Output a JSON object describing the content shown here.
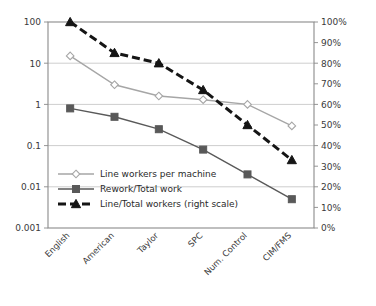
{
  "chart_data": {
    "type": "line",
    "title": "",
    "subtitle": "",
    "xlabel": "",
    "ylabel": "",
    "categories": [
      "English",
      "American",
      "Taylor",
      "SPC",
      "Num. Control",
      "CIM/FMS"
    ],
    "left_axis": {
      "scale": "log",
      "ylim": [
        0.001,
        100
      ],
      "ticks": [
        100,
        10,
        1,
        0.1,
        0.01,
        0.001
      ],
      "tick_labels": [
        "100",
        "10",
        "1",
        "0.1",
        "0.01",
        "0.001"
      ],
      "grid": true
    },
    "right_axis": {
      "scale": "linear",
      "ylim": [
        0,
        100
      ],
      "ticks": [
        100,
        90,
        80,
        70,
        60,
        50,
        40,
        30,
        20,
        10,
        0
      ],
      "tick_labels": [
        "100%",
        "90%",
        "80%",
        "70%",
        "60%",
        "50%",
        "40%",
        "30%",
        "20%",
        "10%",
        "0%"
      ],
      "grid": false
    },
    "legend_position": "inside-lower-left",
    "series": [
      {
        "name": "Line workers per machine",
        "axis": "left",
        "marker": "diamond",
        "color": "#a6a6a6",
        "line_style": "solid",
        "values": [
          15,
          3,
          1.6,
          1.3,
          1.0,
          0.3
        ]
      },
      {
        "name": "Rework/Total work",
        "axis": "left",
        "marker": "square",
        "color": "#595959",
        "line_style": "solid",
        "values": [
          0.8,
          0.5,
          0.25,
          0.08,
          0.02,
          0.005
        ]
      },
      {
        "name": "Line/Total workers (right scale)",
        "axis": "right",
        "marker": "triangle",
        "color": "#151515",
        "line_style": "dashed",
        "values": [
          100,
          85,
          80,
          67,
          50,
          33
        ]
      }
    ]
  },
  "legend": {
    "items": [
      {
        "label": "Line workers per machine"
      },
      {
        "label": "Rework/Total work"
      },
      {
        "label": "Line/Total workers (right scale)"
      }
    ]
  }
}
